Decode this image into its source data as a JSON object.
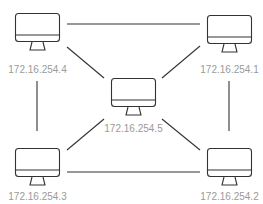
{
  "diagram": {
    "type": "network-topology",
    "colors": {
      "line": "#333333",
      "label": "#9a9a9a",
      "background": "#ffffff"
    },
    "nodes": [
      {
        "id": "n1",
        "label": "172.16.254.1",
        "icon": "desktop-monitor-icon",
        "x": 207,
        "y": 15
      },
      {
        "id": "n2",
        "label": "172.16.254.2",
        "icon": "desktop-monitor-icon",
        "x": 207,
        "y": 148
      },
      {
        "id": "n3",
        "label": "172.16.254.3",
        "icon": "desktop-monitor-icon",
        "x": 15,
        "y": 148
      },
      {
        "id": "n4",
        "label": "172.16.254.4",
        "icon": "desktop-monitor-icon",
        "x": 15,
        "y": 13
      },
      {
        "id": "n5",
        "label": "172.16.254.5",
        "icon": "desktop-monitor-icon",
        "x": 111,
        "y": 78
      }
    ],
    "edges": [
      {
        "from": "n4",
        "to": "n1"
      },
      {
        "from": "n4",
        "to": "n3"
      },
      {
        "from": "n1",
        "to": "n2"
      },
      {
        "from": "n3",
        "to": "n2"
      },
      {
        "from": "n4",
        "to": "n5"
      },
      {
        "from": "n1",
        "to": "n5"
      },
      {
        "from": "n3",
        "to": "n5"
      },
      {
        "from": "n2",
        "to": "n5"
      }
    ]
  }
}
